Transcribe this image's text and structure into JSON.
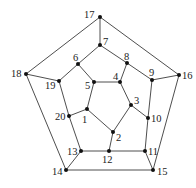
{
  "diagram": {
    "type": "graph",
    "name": "dodecahedron-graph",
    "nodes": [
      {
        "id": "1",
        "x": 87,
        "y": 109,
        "lx": 82,
        "ly": 123
      },
      {
        "id": "2",
        "x": 113,
        "y": 132,
        "lx": 116,
        "ly": 141
      },
      {
        "id": "3",
        "x": 131,
        "y": 105,
        "lx": 134,
        "ly": 104
      },
      {
        "id": "4",
        "x": 120,
        "y": 82,
        "lx": 113,
        "ly": 80
      },
      {
        "id": "5",
        "x": 94,
        "y": 82,
        "lx": 85,
        "ly": 89
      },
      {
        "id": "6",
        "x": 78,
        "y": 64,
        "lx": 73,
        "ly": 61
      },
      {
        "id": "7",
        "x": 100,
        "y": 45,
        "lx": 103,
        "ly": 45
      },
      {
        "id": "8",
        "x": 127,
        "y": 63,
        "lx": 124,
        "ly": 60
      },
      {
        "id": "9",
        "x": 152,
        "y": 80,
        "lx": 149,
        "ly": 76
      },
      {
        "id": "10",
        "x": 148,
        "y": 118,
        "lx": 151,
        "ly": 122
      },
      {
        "id": "11",
        "x": 145,
        "y": 151,
        "lx": 148,
        "ly": 155
      },
      {
        "id": "12",
        "x": 109,
        "y": 151,
        "lx": 102,
        "ly": 163
      },
      {
        "id": "13",
        "x": 81,
        "y": 151,
        "lx": 67,
        "ly": 155
      },
      {
        "id": "14",
        "x": 66,
        "y": 170,
        "lx": 52,
        "ly": 175
      },
      {
        "id": "15",
        "x": 153,
        "y": 170,
        "lx": 157,
        "ly": 175
      },
      {
        "id": "16",
        "x": 179,
        "y": 75,
        "lx": 182,
        "ly": 79
      },
      {
        "id": "17",
        "x": 100,
        "y": 17,
        "lx": 84,
        "ly": 18
      },
      {
        "id": "18",
        "x": 26,
        "y": 74,
        "lx": 11,
        "ly": 77
      },
      {
        "id": "19",
        "x": 59,
        "y": 81,
        "lx": 45,
        "ly": 89
      },
      {
        "id": "20",
        "x": 69,
        "y": 116,
        "lx": 55,
        "ly": 120
      }
    ],
    "edges": [
      [
        "17",
        "7"
      ],
      [
        "17",
        "18"
      ],
      [
        "17",
        "16"
      ],
      [
        "7",
        "6"
      ],
      [
        "7",
        "8"
      ],
      [
        "6",
        "19"
      ],
      [
        "6",
        "5"
      ],
      [
        "8",
        "4"
      ],
      [
        "8",
        "9"
      ],
      [
        "18",
        "19"
      ],
      [
        "18",
        "14"
      ],
      [
        "16",
        "9"
      ],
      [
        "16",
        "15"
      ],
      [
        "19",
        "20"
      ],
      [
        "20",
        "13"
      ],
      [
        "20",
        "1"
      ],
      [
        "9",
        "10"
      ],
      [
        "10",
        "11"
      ],
      [
        "10",
        "3"
      ],
      [
        "5",
        "4"
      ],
      [
        "5",
        "1"
      ],
      [
        "4",
        "3"
      ],
      [
        "3",
        "2"
      ],
      [
        "1",
        "2"
      ],
      [
        "2",
        "12"
      ],
      [
        "13",
        "12"
      ],
      [
        "12",
        "11"
      ],
      [
        "13",
        "14"
      ],
      [
        "11",
        "15"
      ],
      [
        "14",
        "15"
      ]
    ]
  }
}
